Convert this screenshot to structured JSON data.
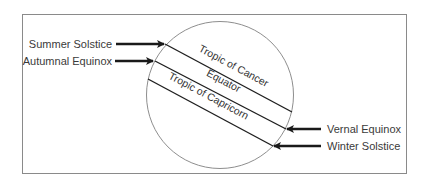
{
  "diagram": {
    "colors": {
      "frame": "#8a8a8a",
      "circle": "#8e8e8e",
      "lines": "#1f1f1f",
      "arrows": "#1a1a1a",
      "text": "#3a3a3a"
    },
    "left_labels": [
      {
        "id": "summer-solstice",
        "text": "Summer Solstice"
      },
      {
        "id": "autumnal-equinox",
        "text": "Autumnal Equinox"
      }
    ],
    "right_labels": [
      {
        "id": "vernal-equinox",
        "text": "Vernal Equinox"
      },
      {
        "id": "winter-solstice",
        "text": "Winter Solstice"
      }
    ],
    "latitudes": [
      {
        "id": "tropic-of-cancer",
        "text": "Tropic of Cancer"
      },
      {
        "id": "equator",
        "text": "Equator"
      },
      {
        "id": "tropic-of-capricorn",
        "text": "Tropic of Capricorn"
      }
    ]
  }
}
